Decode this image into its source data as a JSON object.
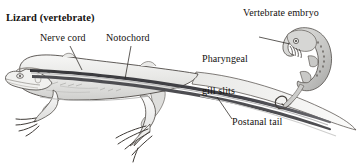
{
  "figure": {
    "background_color": "#ffffff",
    "width": 363,
    "height": 167
  },
  "labels": {
    "title": "Lizard (vertebrate)",
    "nerve_cord": "Nerve cord",
    "notochord": "Notochord",
    "vertebrate_embryo": "Vertebrate embryo",
    "pharyngeal_gill_slits_line1": "Pharyngeal",
    "pharyngeal_gill_slits_line2": "gill slits",
    "postanal_tail": "Postanal tail"
  },
  "colors": {
    "text": "#14110f",
    "leader_line": "#2a2622",
    "outline": "#3a3532",
    "body_fill_light": "#f2f2f0",
    "body_fill_mid": "#dcdcda",
    "body_shade": "#c6c6c4",
    "nerve_cord_dark": "#3c3c3e",
    "notochord_dark": "#4a4a4c",
    "cord_highlight": "#9b9b9c",
    "embryo_fill": "#cfcfcd",
    "embryo_shade": "#a9a9a7"
  }
}
